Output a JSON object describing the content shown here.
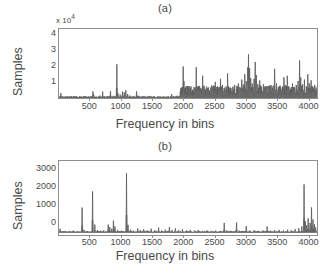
{
  "figure": {
    "background": "#ffffff",
    "line_color": "#555555",
    "axis_color": "#8e8e8e",
    "text_color": "#4a4a4a"
  },
  "panel_a": {
    "title": "(a)",
    "ylabel": "Samples",
    "xlabel": "Frequency in bins",
    "y_multiplier_prefix": "x 10",
    "y_multiplier_exp": "4",
    "yticks": [
      "1",
      "2",
      "3",
      "4"
    ],
    "xticks": [
      "500",
      "1000",
      "1500",
      "2000",
      "2500",
      "3000",
      "3500",
      "4000"
    ]
  },
  "panel_b": {
    "title": "(b)",
    "ylabel": "Samples",
    "xlabel": "Frequency in bins",
    "yticks": [
      "0",
      "1000",
      "2000",
      "3000"
    ],
    "xticks": [
      "500",
      "1000",
      "1500",
      "2000",
      "2500",
      "3000",
      "3500",
      "4000"
    ]
  },
  "chart_data": [
    {
      "type": "line",
      "panel": "a",
      "title": "(a)",
      "xlabel": "Frequency in bins",
      "ylabel": "Samples",
      "y_scale_multiplier": 10000,
      "xlim": [
        0,
        4150
      ],
      "ylim": [
        0,
        45000
      ],
      "yticks": [
        10000,
        20000,
        30000,
        40000
      ],
      "xticks": [
        500,
        1000,
        1500,
        2000,
        2500,
        3000,
        3500,
        4000
      ],
      "grid": false,
      "legend": null,
      "description": "Sparse low-amplitude spectrum for bins 0-1900 with isolated spikes; dense high-amplitude spiky region for bins 1950-4100.",
      "baseline": 300,
      "peaks": [
        {
          "x": 30,
          "y": 3200
        },
        {
          "x": 60,
          "y": 1200
        },
        {
          "x": 95,
          "y": 700
        },
        {
          "x": 140,
          "y": 900
        },
        {
          "x": 200,
          "y": 600
        },
        {
          "x": 265,
          "y": 800
        },
        {
          "x": 330,
          "y": 500
        },
        {
          "x": 400,
          "y": 1100
        },
        {
          "x": 470,
          "y": 600
        },
        {
          "x": 545,
          "y": 4300
        },
        {
          "x": 560,
          "y": 2200
        },
        {
          "x": 600,
          "y": 900
        },
        {
          "x": 660,
          "y": 1500
        },
        {
          "x": 700,
          "y": 4200
        },
        {
          "x": 730,
          "y": 1200
        },
        {
          "x": 790,
          "y": 900
        },
        {
          "x": 830,
          "y": 4500
        },
        {
          "x": 870,
          "y": 1400
        },
        {
          "x": 930,
          "y": 22000
        },
        {
          "x": 945,
          "y": 3000
        },
        {
          "x": 985,
          "y": 2200
        },
        {
          "x": 1020,
          "y": 4200
        },
        {
          "x": 1050,
          "y": 3600
        },
        {
          "x": 1075,
          "y": 5000
        },
        {
          "x": 1105,
          "y": 2600
        },
        {
          "x": 1140,
          "y": 1600
        },
        {
          "x": 1190,
          "y": 900
        },
        {
          "x": 1250,
          "y": 4300
        },
        {
          "x": 1270,
          "y": 1500
        },
        {
          "x": 1330,
          "y": 700
        },
        {
          "x": 1400,
          "y": 900
        },
        {
          "x": 1470,
          "y": 600
        },
        {
          "x": 1540,
          "y": 800
        },
        {
          "x": 1610,
          "y": 700
        },
        {
          "x": 1680,
          "y": 600
        },
        {
          "x": 1750,
          "y": 900
        },
        {
          "x": 1810,
          "y": 2600
        },
        {
          "x": 1850,
          "y": 1200
        },
        {
          "x": 1900,
          "y": 1500
        },
        {
          "x": 1950,
          "y": 4000
        },
        {
          "x": 1975,
          "y": 7000
        },
        {
          "x": 1995,
          "y": 20500
        },
        {
          "x": 2010,
          "y": 11000
        },
        {
          "x": 2030,
          "y": 6500
        },
        {
          "x": 2060,
          "y": 5200
        },
        {
          "x": 2090,
          "y": 4100
        },
        {
          "x": 2120,
          "y": 6000
        },
        {
          "x": 2150,
          "y": 4500
        },
        {
          "x": 2180,
          "y": 5500
        },
        {
          "x": 2205,
          "y": 20000
        },
        {
          "x": 2225,
          "y": 7500
        },
        {
          "x": 2255,
          "y": 5200
        },
        {
          "x": 2285,
          "y": 6200
        },
        {
          "x": 2310,
          "y": 14500
        },
        {
          "x": 2335,
          "y": 8000
        },
        {
          "x": 2365,
          "y": 5400
        },
        {
          "x": 2395,
          "y": 6500
        },
        {
          "x": 2425,
          "y": 5000
        },
        {
          "x": 2455,
          "y": 7000
        },
        {
          "x": 2485,
          "y": 5600
        },
        {
          "x": 2515,
          "y": 10500
        },
        {
          "x": 2540,
          "y": 7200
        },
        {
          "x": 2570,
          "y": 5800
        },
        {
          "x": 2600,
          "y": 12500
        },
        {
          "x": 2625,
          "y": 8500
        },
        {
          "x": 2655,
          "y": 6000
        },
        {
          "x": 2685,
          "y": 7500
        },
        {
          "x": 2710,
          "y": 16000
        },
        {
          "x": 2735,
          "y": 6800
        },
        {
          "x": 2765,
          "y": 5500
        },
        {
          "x": 2795,
          "y": 6200
        },
        {
          "x": 2825,
          "y": 8500
        },
        {
          "x": 2855,
          "y": 6000
        },
        {
          "x": 2885,
          "y": 9500
        },
        {
          "x": 2910,
          "y": 7000
        },
        {
          "x": 2940,
          "y": 12000
        },
        {
          "x": 2965,
          "y": 8800
        },
        {
          "x": 2990,
          "y": 15500
        },
        {
          "x": 3010,
          "y": 11000
        },
        {
          "x": 3035,
          "y": 20000
        },
        {
          "x": 3050,
          "y": 28500
        },
        {
          "x": 3065,
          "y": 19500
        },
        {
          "x": 3085,
          "y": 13000
        },
        {
          "x": 3110,
          "y": 9500
        },
        {
          "x": 3135,
          "y": 12500
        },
        {
          "x": 3155,
          "y": 23500
        },
        {
          "x": 3175,
          "y": 15000
        },
        {
          "x": 3200,
          "y": 9000
        },
        {
          "x": 3230,
          "y": 11500
        },
        {
          "x": 3260,
          "y": 7500
        },
        {
          "x": 3290,
          "y": 9000
        },
        {
          "x": 3320,
          "y": 6500
        },
        {
          "x": 3350,
          "y": 7800
        },
        {
          "x": 3380,
          "y": 6000
        },
        {
          "x": 3410,
          "y": 8500
        },
        {
          "x": 3440,
          "y": 6200
        },
        {
          "x": 3470,
          "y": 19000
        },
        {
          "x": 3495,
          "y": 9500
        },
        {
          "x": 3525,
          "y": 6800
        },
        {
          "x": 3555,
          "y": 8000
        },
        {
          "x": 3585,
          "y": 6000
        },
        {
          "x": 3615,
          "y": 13500
        },
        {
          "x": 3640,
          "y": 8500
        },
        {
          "x": 3670,
          "y": 14500
        },
        {
          "x": 3695,
          "y": 7500
        },
        {
          "x": 3725,
          "y": 6000
        },
        {
          "x": 3755,
          "y": 9500
        },
        {
          "x": 3785,
          "y": 7000
        },
        {
          "x": 3815,
          "y": 8500
        },
        {
          "x": 3845,
          "y": 11000
        },
        {
          "x": 3870,
          "y": 24500
        },
        {
          "x": 3890,
          "y": 13500
        },
        {
          "x": 3915,
          "y": 9000
        },
        {
          "x": 3945,
          "y": 12000
        },
        {
          "x": 3975,
          "y": 7500
        },
        {
          "x": 4000,
          "y": 15500
        },
        {
          "x": 4025,
          "y": 9500
        },
        {
          "x": 4055,
          "y": 11500
        },
        {
          "x": 4085,
          "y": 7000
        },
        {
          "x": 4110,
          "y": 8500
        }
      ]
    },
    {
      "type": "line",
      "panel": "b",
      "title": "(b)",
      "xlabel": "Frequency in bins",
      "ylabel": "Samples",
      "y_scale_multiplier": 1,
      "xlim": [
        0,
        4150
      ],
      "ylim": [
        -120,
        3800
      ],
      "yticks": [
        0,
        1000,
        2000,
        3000
      ],
      "xticks": [
        500,
        1000,
        1500,
        2000,
        2500,
        3000,
        3500,
        4000
      ],
      "grid": false,
      "legend": null,
      "description": "Near-zero baseline with sharp isolated peaks; largest peak ~3150 at bin 1085, plus peaks at 370 (1330), 540 (2190), 3940 (2560) and a cluster at the right edge.",
      "baseline": 30,
      "peaks": [
        {
          "x": 20,
          "y": 210
        },
        {
          "x": 75,
          "y": 90
        },
        {
          "x": 150,
          "y": 70
        },
        {
          "x": 230,
          "y": 110
        },
        {
          "x": 300,
          "y": 80
        },
        {
          "x": 370,
          "y": 1330
        },
        {
          "x": 400,
          "y": 150
        },
        {
          "x": 455,
          "y": 90
        },
        {
          "x": 540,
          "y": 2190
        },
        {
          "x": 575,
          "y": 430
        },
        {
          "x": 615,
          "y": 140
        },
        {
          "x": 665,
          "y": 100
        },
        {
          "x": 720,
          "y": 130
        },
        {
          "x": 790,
          "y": 430
        },
        {
          "x": 815,
          "y": 300
        },
        {
          "x": 845,
          "y": 210
        },
        {
          "x": 875,
          "y": 640
        },
        {
          "x": 900,
          "y": 330
        },
        {
          "x": 940,
          "y": 150
        },
        {
          "x": 1000,
          "y": 110
        },
        {
          "x": 1085,
          "y": 3150
        },
        {
          "x": 1110,
          "y": 420
        },
        {
          "x": 1150,
          "y": 160
        },
        {
          "x": 1200,
          "y": 110
        },
        {
          "x": 1265,
          "y": 230
        },
        {
          "x": 1310,
          "y": 140
        },
        {
          "x": 1360,
          "y": 180
        },
        {
          "x": 1420,
          "y": 120
        },
        {
          "x": 1480,
          "y": 210
        },
        {
          "x": 1540,
          "y": 130
        },
        {
          "x": 1600,
          "y": 270
        },
        {
          "x": 1650,
          "y": 120
        },
        {
          "x": 1710,
          "y": 160
        },
        {
          "x": 1775,
          "y": 300
        },
        {
          "x": 1820,
          "y": 140
        },
        {
          "x": 1870,
          "y": 230
        },
        {
          "x": 1925,
          "y": 130
        },
        {
          "x": 1985,
          "y": 180
        },
        {
          "x": 2050,
          "y": 120
        },
        {
          "x": 2110,
          "y": 150
        },
        {
          "x": 2175,
          "y": 110
        },
        {
          "x": 2240,
          "y": 140
        },
        {
          "x": 2310,
          "y": 100
        },
        {
          "x": 2380,
          "y": 120
        },
        {
          "x": 2450,
          "y": 95
        },
        {
          "x": 2520,
          "y": 110
        },
        {
          "x": 2590,
          "y": 90
        },
        {
          "x": 2660,
          "y": 520
        },
        {
          "x": 2700,
          "y": 120
        },
        {
          "x": 2760,
          "y": 100
        },
        {
          "x": 2855,
          "y": 540
        },
        {
          "x": 2900,
          "y": 110
        },
        {
          "x": 2960,
          "y": 95
        },
        {
          "x": 3010,
          "y": 350
        },
        {
          "x": 3070,
          "y": 110
        },
        {
          "x": 3140,
          "y": 130
        },
        {
          "x": 3210,
          "y": 100
        },
        {
          "x": 3280,
          "y": 120
        },
        {
          "x": 3350,
          "y": 330
        },
        {
          "x": 3400,
          "y": 110
        },
        {
          "x": 3470,
          "y": 130
        },
        {
          "x": 3540,
          "y": 150
        },
        {
          "x": 3610,
          "y": 120
        },
        {
          "x": 3680,
          "y": 160
        },
        {
          "x": 3740,
          "y": 130
        },
        {
          "x": 3800,
          "y": 190
        },
        {
          "x": 3860,
          "y": 240
        },
        {
          "x": 3905,
          "y": 330
        },
        {
          "x": 3940,
          "y": 2560
        },
        {
          "x": 3960,
          "y": 620
        },
        {
          "x": 3985,
          "y": 400
        },
        {
          "x": 4010,
          "y": 760
        },
        {
          "x": 4035,
          "y": 520
        },
        {
          "x": 4060,
          "y": 1340
        },
        {
          "x": 4085,
          "y": 700
        },
        {
          "x": 4110,
          "y": 450
        },
        {
          "x": 4130,
          "y": 280
        }
      ]
    }
  ]
}
